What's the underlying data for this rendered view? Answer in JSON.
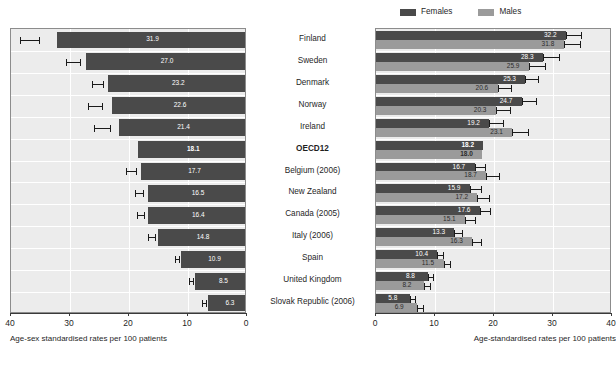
{
  "figure": {
    "categories": [
      "Finland",
      "Sweden",
      "Denmark",
      "Norway",
      "Ireland",
      "OECD12",
      "Belgium (2006)",
      "New Zealand",
      "Canada (2005)",
      "Italy (2006)",
      "Spain",
      "United Kingdom",
      "Slovak Republic (2006)"
    ],
    "emphasis_category": "OECD12"
  },
  "legend": {
    "females_label": "Females",
    "males_label": "Males",
    "females_color": "#4a4a4a",
    "males_color": "#9b9b9b"
  },
  "chart_data": [
    {
      "type": "bar",
      "panel": "left",
      "orientation": "horizontal",
      "direction": "reversed",
      "title": "",
      "xlabel": "Age-sex standardised rates per 100 patients",
      "ylabel": "",
      "xlim": [
        0,
        40
      ],
      "xticks": [
        40,
        30,
        20,
        10,
        0
      ],
      "xticklabels": [
        "40",
        "30",
        "20",
        "10",
        "0"
      ],
      "grid": true,
      "categories": [
        "Finland",
        "Sweden",
        "Denmark",
        "Norway",
        "Ireland",
        "OECD12",
        "Belgium (2006)",
        "New Zealand",
        "Canada (2005)",
        "Italy (2006)",
        "Spain",
        "United Kingdom",
        "Slovak Republic (2006)"
      ],
      "values": [
        31.9,
        27.0,
        23.2,
        22.6,
        21.4,
        18.1,
        17.7,
        16.5,
        16.4,
        14.8,
        10.9,
        8.5,
        6.3
      ],
      "value_labels": [
        "31.9",
        "27.0",
        "23.2",
        "22.6",
        "21.4",
        "18.1",
        "17.7",
        "16.5",
        "16.4",
        "14.8",
        "10.9",
        "8.5",
        "6.3"
      ],
      "errors_low": [
        38.5,
        30.6,
        26.3,
        27.0,
        26.0,
        18.1,
        20.5,
        19.0,
        18.6,
        16.8,
        12.2,
        9.8,
        7.6
      ],
      "errors_high": [
        35.3,
        28.3,
        24.4,
        24.6,
        23.2,
        18.1,
        18.8,
        17.6,
        17.4,
        15.6,
        11.5,
        9.1,
        6.9
      ],
      "series_color": "#4a4a4a"
    },
    {
      "type": "bar",
      "panel": "right",
      "orientation": "horizontal",
      "direction": "normal",
      "title": "",
      "xlabel": "Age-standardised rates per 100 patients",
      "ylabel": "",
      "xlim": [
        0,
        40
      ],
      "xticks": [
        0,
        10,
        20,
        30,
        40
      ],
      "xticklabels": [
        "0",
        "10",
        "20",
        "30",
        "40"
      ],
      "grid": true,
      "categories": [
        "Finland",
        "Sweden",
        "Denmark",
        "Norway",
        "Ireland",
        "OECD12",
        "Belgium (2006)",
        "New Zealand",
        "Canada (2005)",
        "Italy (2006)",
        "Spain",
        "United Kingdom",
        "Slovak Republic (2006)"
      ],
      "series": [
        {
          "name": "Females",
          "color": "#4a4a4a",
          "values": [
            32.2,
            28.3,
            25.3,
            24.7,
            19.2,
            18.2,
            16.7,
            15.9,
            17.6,
            13.3,
            10.4,
            8.8,
            5.8
          ],
          "value_labels": [
            "32.2",
            "28.3",
            "25.3",
            "24.7",
            "19.2",
            "18.2",
            "16.7",
            "15.9",
            "17.6",
            "13.3",
            "10.4",
            "8.8",
            "5.8"
          ],
          "errors_high": [
            34.8,
            31.0,
            27.5,
            27.2,
            21.6,
            18.2,
            18.4,
            17.8,
            19.3,
            14.6,
            11.4,
            9.7,
            6.6
          ]
        },
        {
          "name": "Males",
          "color": "#9b9b9b",
          "values": [
            31.8,
            25.9,
            20.6,
            20.3,
            23.1,
            18.0,
            18.7,
            17.2,
            15.1,
            16.3,
            11.5,
            8.2,
            6.9
          ],
          "value_labels": [
            "31.8",
            "25.9",
            "20.6",
            "20.3",
            "23.1",
            "18.0",
            "18.7",
            "17.2",
            "15.1",
            "16.3",
            "11.5",
            "8.2",
            "6.9"
          ],
          "errors_high": [
            34.5,
            28.6,
            22.9,
            22.7,
            25.8,
            18.0,
            20.9,
            19.2,
            16.7,
            17.8,
            12.6,
            9.1,
            7.9
          ]
        }
      ]
    }
  ]
}
